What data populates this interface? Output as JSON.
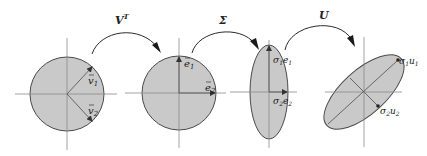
{
  "figure": {
    "panels": [
      {
        "id": "unit-circle-v",
        "vectors": [
          {
            "name": "v1",
            "label": "v",
            "sub": "1"
          },
          {
            "name": "v2",
            "label": "v",
            "sub": "2"
          }
        ]
      },
      {
        "id": "unit-circle-e",
        "vectors": [
          {
            "name": "e1",
            "label": "e",
            "sub": "1"
          },
          {
            "name": "e2",
            "label": "e",
            "sub": "2"
          }
        ]
      },
      {
        "id": "scaled-ellipse",
        "vectors": [
          {
            "name": "sigma1e1",
            "coef": "σ",
            "coef_sub": "1",
            "label": "e",
            "sub": "1"
          },
          {
            "name": "sigma2e2",
            "coef": "σ",
            "coef_sub": "2",
            "label": "e",
            "sub": "2"
          }
        ]
      },
      {
        "id": "rotated-ellipse",
        "vectors": [
          {
            "name": "sigma1u1",
            "coef": "σ",
            "coef_sub": "1",
            "label": "u",
            "sub": "1"
          },
          {
            "name": "sigma2u2",
            "coef": "σ",
            "coef_sub": "2",
            "label": "u",
            "sub": "2"
          }
        ]
      }
    ],
    "transforms": [
      {
        "name": "V",
        "sup": "T"
      },
      {
        "name": "Σ",
        "sup": ""
      },
      {
        "name": "U",
        "sup": ""
      }
    ],
    "colors": {
      "fill": "#c9c9c9",
      "stroke": "#4a4a4a",
      "axis": "#8a8a8a"
    }
  }
}
